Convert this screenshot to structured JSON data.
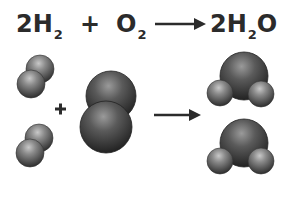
{
  "equation": {
    "reactant1": {
      "coef": "2",
      "elem": "H",
      "sub": "2"
    },
    "plus": "+",
    "reactant2": {
      "elem": "O",
      "sub": "2"
    },
    "product": {
      "coef": "2",
      "elem": "H",
      "sub": "2",
      "tail": "O"
    },
    "arrow": "yields-arrow"
  },
  "diagram": {
    "plus": "+",
    "h2_molecules": 2,
    "o2_molecules": 1,
    "h2o_molecules": 2
  },
  "colors": {
    "text": "#2b2b2b",
    "atom_dark": "#3a3a3a",
    "atom_mid": "#7a7a7a",
    "atom_light": "#bdbdbd"
  }
}
